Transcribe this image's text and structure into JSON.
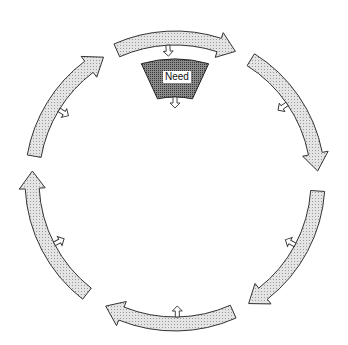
{
  "diagram": {
    "type": "cycle",
    "center": {
      "x": 175,
      "y": 181
    },
    "radius": 150,
    "arrow_width": 14,
    "colors": {
      "arrow_fill": "#d9d9d9",
      "arrow_stroke": "#333333",
      "need_fill": "#7a7a7a",
      "background": "#ffffff"
    },
    "arrows": [
      {
        "id": "arc-top",
        "start_deg": 246,
        "end_deg": 295,
        "inner_arrow": "down"
      },
      {
        "id": "arc-upper-right",
        "start_deg": 302,
        "end_deg": 356,
        "inner_arrow": "down-left"
      },
      {
        "id": "arc-lower-right",
        "start_deg": 4,
        "end_deg": 59,
        "inner_arrow": "up-left"
      },
      {
        "id": "arc-bottom",
        "start_deg": 66,
        "end_deg": 119,
        "inner_arrow": "up"
      },
      {
        "id": "arc-lower-left",
        "start_deg": 128,
        "end_deg": 184,
        "inner_arrow": "up-right"
      },
      {
        "id": "arc-upper-left",
        "start_deg": 190,
        "end_deg": 240,
        "inner_arrow": "down-right"
      }
    ],
    "center_node": {
      "label": "Need",
      "arrow": "down"
    }
  }
}
